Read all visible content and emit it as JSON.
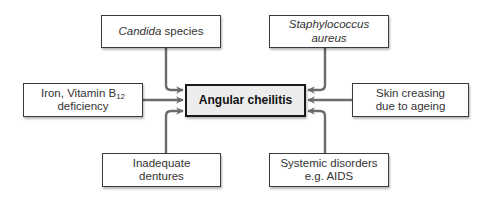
{
  "diagram": {
    "type": "cause-effect",
    "center": {
      "label": "Angular cheilitis"
    },
    "causes": {
      "top_left": {
        "italic": "Candida",
        "text": " species"
      },
      "top_right": {
        "italic": "Staphylococcus aureus"
      },
      "left": {
        "line1": "Iron, Vitamin B",
        "line1_sub": "12",
        "line2": "deficiency"
      },
      "right": {
        "line1": "Skin creasing",
        "line2": "due to ageing"
      },
      "bottom_left": {
        "line1": "Inadequate",
        "line2": "dentures"
      },
      "bottom_right": {
        "line1": "Systemic disorders",
        "line2": "e.g. AIDS"
      }
    },
    "colors": {
      "arrow": "#6b6b6b",
      "box_border": "#3a3a3a",
      "center_fill": "#ececec",
      "center_border": "#1a1a1a"
    }
  }
}
